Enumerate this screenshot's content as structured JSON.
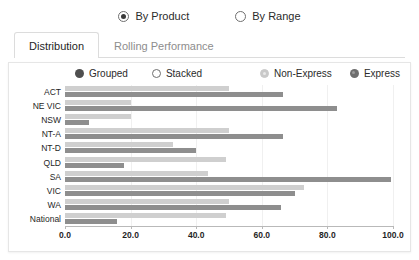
{
  "view_mode": {
    "options": [
      {
        "label": "By Product",
        "selected": true
      },
      {
        "label": "By Range",
        "selected": false
      }
    ]
  },
  "tabs": [
    {
      "label": "Distribution",
      "active": true
    },
    {
      "label": "Rolling Performance",
      "active": false
    }
  ],
  "legend": {
    "mode_options": [
      {
        "label": "Grouped",
        "selected": true
      },
      {
        "label": "Stacked",
        "selected": false
      }
    ],
    "series": [
      {
        "label": "Non-Express",
        "color": "#cfcfcf"
      },
      {
        "label": "Express",
        "color": "#8e8e8e"
      }
    ]
  },
  "chart_data": {
    "type": "bar",
    "orientation": "horizontal",
    "title": "",
    "xlabel": "",
    "ylabel": "",
    "xlim": [
      0,
      100
    ],
    "xticks": [
      "0.0",
      "20.0",
      "40.0",
      "60.0",
      "80.0",
      "100.0"
    ],
    "xtick_values": [
      0,
      20,
      40,
      60,
      80,
      100
    ],
    "grid": true,
    "legend_position": "top-right",
    "categories": [
      "ACT",
      "NE VIC",
      "NSW",
      "NT-A",
      "NT-D",
      "QLD",
      "SA",
      "VIC",
      "WA",
      "National"
    ],
    "series": [
      {
        "name": "Non-Express",
        "color": "#cfcfcf",
        "values": [
          50.0,
          20.0,
          20.0,
          50.0,
          33.0,
          49.0,
          43.5,
          73.0,
          50.0,
          49.0
        ]
      },
      {
        "name": "Express",
        "color": "#8e8e8e",
        "values": [
          66.5,
          83.0,
          7.3,
          66.5,
          40.0,
          18.0,
          99.5,
          70.0,
          66.0,
          16.0
        ]
      }
    ]
  }
}
